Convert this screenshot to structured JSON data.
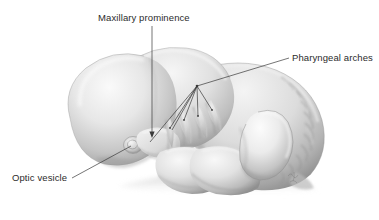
{
  "figure": {
    "background_color": "#ffffff",
    "width": 379,
    "height": 220
  },
  "annotations": {
    "leader_line_color": "#3a3a3a",
    "text_color": "#2b2b2b",
    "items": [
      {
        "id": "maxillary-prominence",
        "label": "Maxillary prominence",
        "label_x": 98,
        "label_y": 12,
        "leader": {
          "type": "arrow",
          "x1": 152,
          "y1": 26,
          "x2": 152,
          "y2": 137
        }
      },
      {
        "id": "pharyngeal-arches",
        "label": "Pharyngeal arches",
        "label_x": 292,
        "label_y": 52,
        "leader": {
          "type": "fan",
          "hub_x": 197,
          "hub_y": 86,
          "tail_x": 289,
          "tail_y": 58
        }
      },
      {
        "id": "optic-vesicle",
        "label": "Optic vesicle",
        "label_x": 12,
        "label_y": 172,
        "leader": {
          "type": "arrow",
          "x1": 72,
          "y1": 178,
          "x2": 133,
          "y2": 145
        }
      }
    ]
  },
  "anatomy": {
    "structures": [
      {
        "name": "forebrain-prominence",
        "visible": true
      },
      {
        "name": "midbrain-hindbrain",
        "visible": true
      },
      {
        "name": "optic-vesicle",
        "visible": true
      },
      {
        "name": "maxillary-prominence",
        "visible": true
      },
      {
        "name": "mandibular-arch",
        "visible": true
      },
      {
        "name": "pharyngeal-arch-1",
        "visible": true
      },
      {
        "name": "pharyngeal-arch-2",
        "visible": true
      },
      {
        "name": "pharyngeal-arch-3",
        "visible": true
      },
      {
        "name": "pharyngeal-arch-4",
        "visible": true
      },
      {
        "name": "heart-bulge",
        "visible": true
      },
      {
        "name": "upper-limb-bud",
        "visible": true
      },
      {
        "name": "somites",
        "visible": true,
        "count": 12
      },
      {
        "name": "trunk-dorsal-curve",
        "visible": true
      },
      {
        "name": "artist-signature",
        "visible": true
      }
    ],
    "palette": {
      "lightest": "#fbfbfb",
      "light": "#e8e8e8",
      "mid": "#cfcfcf",
      "mid_dark": "#a8a8a8",
      "dark": "#8a8a8a",
      "darkest": "#6a6a6a",
      "outline": "#9a9a9a"
    }
  }
}
